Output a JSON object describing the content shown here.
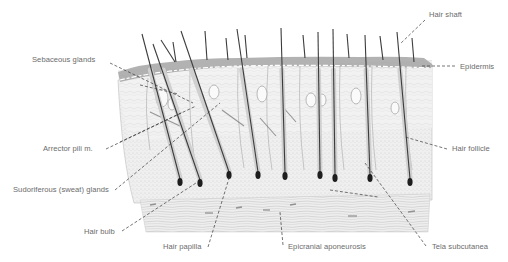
{
  "diagram": {
    "colors": {
      "background": "#ffffff",
      "label_text": "#6b6b6b",
      "leader_line": "#3a3a3a",
      "hair_shaft": "#3c3c3c",
      "tissue_fill": "#ececec",
      "epidermis": "#9a9a9a",
      "bulb_dark": "#1e1e1e"
    },
    "labels": [
      {
        "id": "hair-shaft",
        "text": "Hair shaft",
        "x": 429,
        "y": 15
      },
      {
        "id": "sebaceous-glands",
        "text": "Sebaceous glands",
        "x": 32,
        "y": 58
      },
      {
        "id": "epidermis",
        "text": "Epidermis",
        "x": 460,
        "y": 63
      },
      {
        "id": "arrector-pili",
        "text": "Arrector pili m.",
        "x": 43,
        "y": 146
      },
      {
        "id": "hair-follicle",
        "text": "Hair follicle",
        "x": 452,
        "y": 146
      },
      {
        "id": "sudoriferous-glands",
        "text": "Sudoriferous (sweat) glands",
        "x": 13,
        "y": 187
      },
      {
        "id": "hair-bulb",
        "text": "Hair bulb",
        "x": 84,
        "y": 228
      },
      {
        "id": "hair-papilla",
        "text": "Hair papilla",
        "x": 163,
        "y": 243
      },
      {
        "id": "epicranial-aponeurosis",
        "text": "Epicranial aponeurosis",
        "x": 288,
        "y": 244
      },
      {
        "id": "tela-subcutanea",
        "text": "Tela subcutanea",
        "x": 432,
        "y": 244
      }
    ],
    "leaders": [
      {
        "for": "hair-shaft",
        "x1": 425,
        "y1": 20,
        "x2": 400,
        "y2": 44
      },
      {
        "for": "sebaceous-glands",
        "x1": 110,
        "y1": 63,
        "x2": 193,
        "y2": 103
      },
      {
        "for": "sebaceous-glands",
        "x1": 140,
        "y1": 85,
        "x2": 178,
        "y2": 94
      },
      {
        "for": "epidermis",
        "x1": 455,
        "y1": 66,
        "x2": 420,
        "y2": 66
      },
      {
        "for": "arrector-pili",
        "x1": 106,
        "y1": 149,
        "x2": 196,
        "y2": 106
      },
      {
        "for": "arrector-pili",
        "x1": 120,
        "y1": 142,
        "x2": 183,
        "y2": 112
      },
      {
        "for": "hair-follicle",
        "x1": 447,
        "y1": 149,
        "x2": 405,
        "y2": 137
      },
      {
        "for": "sudoriferous-glands",
        "x1": 115,
        "y1": 190,
        "x2": 220,
        "y2": 103
      },
      {
        "for": "hair-bulb",
        "x1": 122,
        "y1": 231,
        "x2": 196,
        "y2": 183
      },
      {
        "for": "hair-papilla",
        "x1": 208,
        "y1": 247,
        "x2": 230,
        "y2": 175
      },
      {
        "for": "epicranial-aponeurosis",
        "x1": 283,
        "y1": 245,
        "x2": 280,
        "y2": 212
      },
      {
        "for": "epicranial-aponeurosis",
        "x1": 330,
        "y1": 190,
        "x2": 378,
        "y2": 197
      },
      {
        "for": "tela-subcutanea",
        "x1": 426,
        "y1": 246,
        "x2": 365,
        "y2": 163
      }
    ],
    "hairs": [
      {
        "top_x": 142,
        "top_y": 34,
        "bot_x": 180,
        "bot_y": 182,
        "bulb": true
      },
      {
        "top_x": 153,
        "top_y": 44,
        "bot_x": 200,
        "bot_y": 183,
        "bulb": true
      },
      {
        "top_x": 161,
        "top_y": 40,
        "bot_x": 175,
        "bot_y": 62,
        "bulb": false
      },
      {
        "top_x": 173,
        "top_y": 42,
        "bot_x": 176,
        "bot_y": 62,
        "bulb": false
      },
      {
        "top_x": 181,
        "top_y": 31,
        "bot_x": 229,
        "bot_y": 175,
        "bulb": true
      },
      {
        "top_x": 205,
        "top_y": 31,
        "bot_x": 207,
        "bot_y": 60,
        "bulb": false
      },
      {
        "top_x": 226,
        "top_y": 38,
        "bot_x": 228,
        "bot_y": 60,
        "bulb": false
      },
      {
        "top_x": 237,
        "top_y": 29,
        "bot_x": 258,
        "bot_y": 175,
        "bulb": true
      },
      {
        "top_x": 245,
        "top_y": 35,
        "bot_x": 247,
        "bot_y": 58,
        "bulb": false
      },
      {
        "top_x": 281,
        "top_y": 28,
        "bot_x": 285,
        "bot_y": 176,
        "bulb": true
      },
      {
        "top_x": 303,
        "top_y": 35,
        "bot_x": 305,
        "bot_y": 58,
        "bulb": false
      },
      {
        "top_x": 318,
        "top_y": 32,
        "bot_x": 320,
        "bot_y": 175,
        "bulb": true
      },
      {
        "top_x": 333,
        "top_y": 29,
        "bot_x": 335,
        "bot_y": 178,
        "bulb": true
      },
      {
        "top_x": 347,
        "top_y": 34,
        "bot_x": 349,
        "bot_y": 58,
        "bulb": false
      },
      {
        "top_x": 365,
        "top_y": 35,
        "bot_x": 370,
        "bot_y": 178,
        "bulb": true
      },
      {
        "top_x": 380,
        "top_y": 36,
        "bot_x": 383,
        "bot_y": 60,
        "bulb": false
      },
      {
        "top_x": 397,
        "top_y": 32,
        "bot_x": 410,
        "bot_y": 182,
        "bulb": true
      },
      {
        "top_x": 412,
        "top_y": 38,
        "bot_x": 414,
        "bot_y": 62,
        "bulb": false
      }
    ]
  }
}
